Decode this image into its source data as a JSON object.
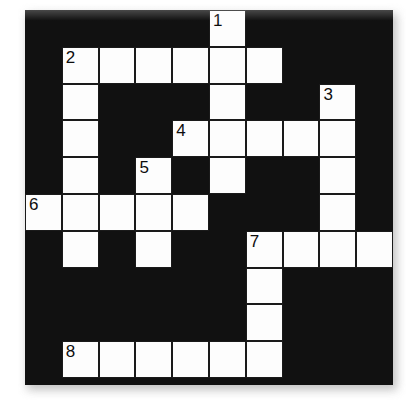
{
  "puzzle": {
    "type": "crossword-grid",
    "title": "Crossword Puzzle Grid",
    "columns": 10,
    "rows": 10,
    "cell_size": 36.8,
    "origin_x": 25,
    "origin_y": 10,
    "colors": {
      "block": "#111111",
      "cell": "#fdfdfd",
      "cell_border": "#1a1a1a",
      "number": "#0d0d0d",
      "page": "#ffffff",
      "shadow": "#b9b9b9"
    },
    "numbered_clues": [
      1,
      2,
      3,
      4,
      5,
      6,
      7,
      8
    ],
    "cells": [
      {
        "row": 0,
        "col": 5,
        "number": "1",
        "letter": ""
      },
      {
        "row": 1,
        "col": 1,
        "number": "2",
        "letter": ""
      },
      {
        "row": 1,
        "col": 2,
        "number": "",
        "letter": ""
      },
      {
        "row": 1,
        "col": 3,
        "number": "",
        "letter": ""
      },
      {
        "row": 1,
        "col": 4,
        "number": "",
        "letter": ""
      },
      {
        "row": 1,
        "col": 5,
        "number": "",
        "letter": ""
      },
      {
        "row": 1,
        "col": 6,
        "number": "",
        "letter": ""
      },
      {
        "row": 2,
        "col": 1,
        "number": "",
        "letter": ""
      },
      {
        "row": 2,
        "col": 5,
        "number": "",
        "letter": ""
      },
      {
        "row": 2,
        "col": 8,
        "number": "3",
        "letter": ""
      },
      {
        "row": 3,
        "col": 1,
        "number": "",
        "letter": ""
      },
      {
        "row": 3,
        "col": 4,
        "number": "4",
        "letter": ""
      },
      {
        "row": 3,
        "col": 5,
        "number": "",
        "letter": ""
      },
      {
        "row": 3,
        "col": 6,
        "number": "",
        "letter": ""
      },
      {
        "row": 3,
        "col": 7,
        "number": "",
        "letter": ""
      },
      {
        "row": 3,
        "col": 8,
        "number": "",
        "letter": ""
      },
      {
        "row": 4,
        "col": 1,
        "number": "",
        "letter": ""
      },
      {
        "row": 4,
        "col": 3,
        "number": "5",
        "letter": ""
      },
      {
        "row": 4,
        "col": 5,
        "number": "",
        "letter": ""
      },
      {
        "row": 4,
        "col": 8,
        "number": "",
        "letter": ""
      },
      {
        "row": 5,
        "col": 0,
        "number": "6",
        "letter": ""
      },
      {
        "row": 5,
        "col": 1,
        "number": "",
        "letter": ""
      },
      {
        "row": 5,
        "col": 2,
        "number": "",
        "letter": ""
      },
      {
        "row": 5,
        "col": 3,
        "number": "",
        "letter": ""
      },
      {
        "row": 5,
        "col": 4,
        "number": "",
        "letter": ""
      },
      {
        "row": 5,
        "col": 8,
        "number": "",
        "letter": ""
      },
      {
        "row": 6,
        "col": 1,
        "number": "",
        "letter": ""
      },
      {
        "row": 6,
        "col": 3,
        "number": "",
        "letter": ""
      },
      {
        "row": 6,
        "col": 6,
        "number": "7",
        "letter": ""
      },
      {
        "row": 6,
        "col": 7,
        "number": "",
        "letter": ""
      },
      {
        "row": 6,
        "col": 8,
        "number": "",
        "letter": ""
      },
      {
        "row": 6,
        "col": 9,
        "number": "",
        "letter": ""
      },
      {
        "row": 7,
        "col": 6,
        "number": "",
        "letter": ""
      },
      {
        "row": 8,
        "col": 6,
        "number": "",
        "letter": ""
      },
      {
        "row": 9,
        "col": 1,
        "number": "8",
        "letter": ""
      },
      {
        "row": 9,
        "col": 2,
        "number": "",
        "letter": ""
      },
      {
        "row": 9,
        "col": 3,
        "number": "",
        "letter": ""
      },
      {
        "row": 9,
        "col": 4,
        "number": "",
        "letter": ""
      },
      {
        "row": 9,
        "col": 5,
        "number": "",
        "letter": ""
      },
      {
        "row": 9,
        "col": 6,
        "number": "",
        "letter": ""
      }
    ]
  }
}
